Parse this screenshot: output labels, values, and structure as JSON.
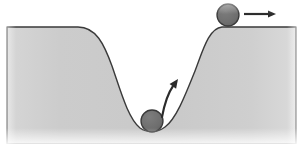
{
  "figure": {
    "canvas": {
      "width": 301,
      "height": 144
    },
    "background_color": "#ffffff"
  },
  "terrain": {
    "name": "potential-well-ground",
    "fill_color": "#cfcfcf",
    "outline_color": "#3a3a3a",
    "outline_width": 1.4,
    "ground_level_y": 27,
    "well_bottom_y": 132,
    "left_ground_start_x": 7,
    "left_shoulder_x": 80,
    "well_bottom_x": 152,
    "right_shoulder_x": 218,
    "right_ground_end_x": 296,
    "path": "M 7 27 L 78 27 C 96 27 104 44 112 66 C 121 92 128 118 140 128 C 147 133 157 133 165 127 C 176 119 185 96 195 71 C 203 50 209 28 222 27 L 296 27 L 296 144 L 7 144 Z"
  },
  "balls": [
    {
      "name": "ball-on-plateau",
      "label": "upper ball at rest on flat ground",
      "cx": 228,
      "cy": 15,
      "r": 11,
      "fill_color": "#6f6f6f",
      "outline_color": "#3a3a3a"
    },
    {
      "name": "ball-in-well",
      "label": "lower ball resting at bottom of well",
      "cx": 152,
      "cy": 121,
      "r": 11,
      "fill_color": "#6f6f6f",
      "outline_color": "#3a3a3a"
    }
  ],
  "arrows": [
    {
      "name": "horizontal-motion-arrow",
      "label": "rightward motion arrow",
      "direction": "right",
      "x1": 244,
      "y1": 14,
      "x2": 276,
      "y2": 14,
      "color": "#2b2b2b",
      "width": 2.2,
      "head_length": 8,
      "head_width": 7
    },
    {
      "name": "uphill-motion-arrow",
      "label": "curved arrow pointing up the right wall of the well",
      "direction": "up-right",
      "x1": 162,
      "y1": 117,
      "cx": 166,
      "cy": 96,
      "x2": 178,
      "y2": 79,
      "color": "#2b2b2b",
      "width": 2.2,
      "head_length": 9,
      "head_width": 8
    }
  ]
}
